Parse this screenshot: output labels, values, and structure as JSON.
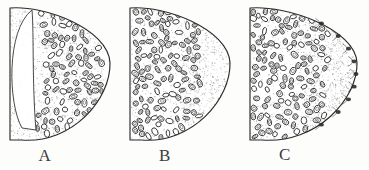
{
  "figure": {
    "background_color": "#fdfdfc",
    "ink_color": "#2b2b2b",
    "stipple_color": "#8a8a86",
    "panel_count": 3
  },
  "panels": [
    {
      "id": "A",
      "label": "A",
      "label_x": 45,
      "label_y": 146,
      "x": 4,
      "width": 114,
      "description": "Crescent / D-shaped section with a large pale empty lens-shaped cavity along the inner left margin; oval cells distributed evenly across the stippled body.",
      "has_empty_cavity": true,
      "cavity_side": "left",
      "cell_distribution": "even-throughout",
      "cell_count": 84,
      "rim_nodules": 0,
      "stipple_density": "light"
    },
    {
      "id": "B",
      "label": "B",
      "label_x": 165,
      "label_y": 146,
      "x": 124,
      "width": 114,
      "description": "Crescent section with cells densely massed in the left two-thirds and a clear stippled crescent of cell-free matrix along the right convex margin.",
      "has_empty_cavity": false,
      "cavity_side": "none",
      "cell_distribution": "left-dense",
      "cell_count": 112,
      "rim_nodules": 0,
      "stipple_density": "medium"
    },
    {
      "id": "C",
      "label": "C",
      "label_x": 285,
      "label_y": 145,
      "x": 244,
      "width": 121,
      "description": "Crescent section with cells crowded into the left half, a broad stippled cell-free zone at the right, and a series of small dark nodules spaced along the outer right rim.",
      "has_empty_cavity": false,
      "cavity_side": "none",
      "cell_distribution": "left-crowded",
      "cell_count": 120,
      "rim_nodules": 9,
      "stipple_density": "medium-heavy"
    }
  ]
}
